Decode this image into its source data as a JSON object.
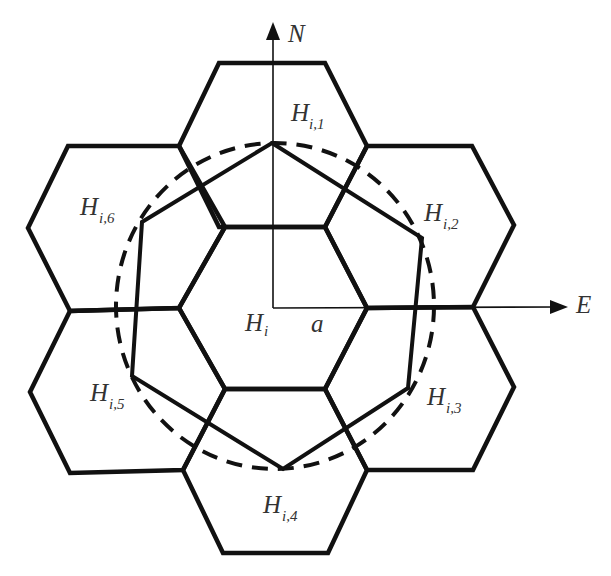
{
  "diagram": {
    "type": "hexagonal-cell-neighborhood",
    "axes": {
      "north_label": "N",
      "east_label": "E",
      "radius_label": "a"
    },
    "center_cell": {
      "label_main": "H",
      "label_sub": "i"
    },
    "neighbor_cells": [
      {
        "id": 1,
        "label_main": "H",
        "label_sub": "i,1",
        "direction": "north"
      },
      {
        "id": 2,
        "label_main": "H",
        "label_sub": "i,2",
        "direction": "north-east"
      },
      {
        "id": 3,
        "label_main": "H",
        "label_sub": "i,3",
        "direction": "south-east"
      },
      {
        "id": 4,
        "label_main": "H",
        "label_sub": "i,4",
        "direction": "south"
      },
      {
        "id": 5,
        "label_main": "H",
        "label_sub": "i,5",
        "direction": "south-west"
      },
      {
        "id": 6,
        "label_main": "H",
        "label_sub": "i,6",
        "direction": "north-west"
      }
    ],
    "overlays": {
      "dashed_circle": "circle through neighbor hexagon centers",
      "solid_polygon": "hexagon connecting neighbor centers"
    },
    "colors": {
      "stroke": "#111111",
      "label": "#333333",
      "background": "#ffffff"
    }
  }
}
